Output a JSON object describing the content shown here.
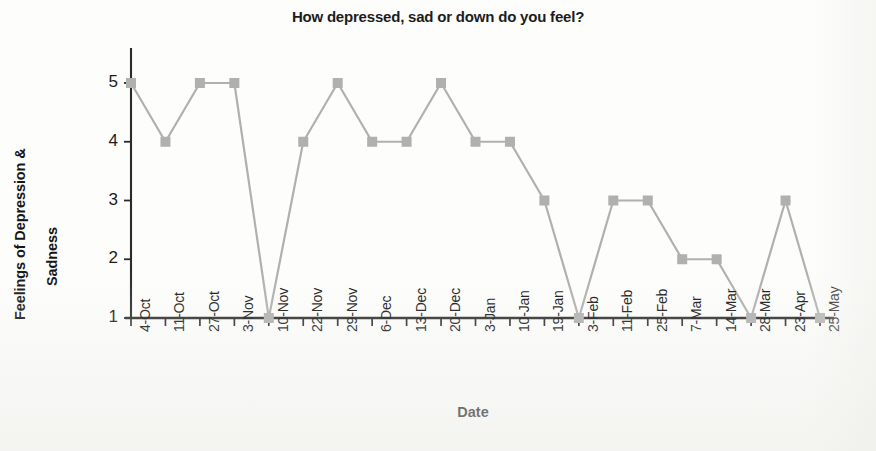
{
  "chart_data": {
    "type": "line",
    "title": "How depressed, sad or down do you feel?",
    "xlabel": "Date",
    "ylabel": "Feelings of Depression & Sadness",
    "ylabel_line1": "Feelings of Depression &",
    "ylabel_line2": "Sadness",
    "categories": [
      "4-Oct",
      "11-Oct",
      "27-Oct",
      "3-Nov",
      "10-Nov",
      "22-Nov",
      "29-Nov",
      "6-Dec",
      "13-Dec",
      "20-Dec",
      "3-Jan",
      "10-Jan",
      "19-Jan",
      "3-Feb",
      "11-Feb",
      "25-Feb",
      "7-Mar",
      "14-Mar",
      "28-Mar",
      "23-Apr",
      "25-May"
    ],
    "values": [
      5,
      4,
      5,
      5,
      1,
      4,
      5,
      4,
      4,
      5,
      4,
      4,
      3,
      1,
      3,
      3,
      2,
      2,
      1,
      3,
      1
    ],
    "y_ticks": [
      1,
      2,
      3,
      4,
      5
    ],
    "ylim": [
      1,
      5
    ],
    "grid": false,
    "legend": "none",
    "series_color": "#b0b0b0",
    "marker": "square",
    "axis_color": "#2b2b2b"
  }
}
